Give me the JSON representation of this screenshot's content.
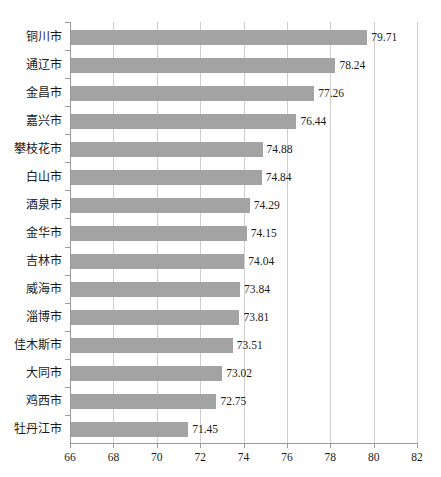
{
  "chart_data": {
    "type": "bar",
    "orientation": "horizontal",
    "title": "",
    "subtitle": "",
    "xlabel": "",
    "ylabel": "",
    "xlim": [
      66,
      82
    ],
    "ylim": null,
    "grid": "vertical",
    "legend": null,
    "legend_position": "none",
    "bar_color": "#a3a3a3",
    "axis_color": "#9a9a9a",
    "gridline_color": "#cfcfcf",
    "xticks": [
      66,
      68,
      70,
      72,
      74,
      76,
      78,
      80,
      82
    ],
    "xtick_labels": [
      "66",
      "68",
      "70",
      "72",
      "74",
      "76",
      "78",
      "80",
      "82"
    ],
    "categories": [
      "铜川市",
      "通辽市",
      "金昌市",
      "嘉兴市",
      "攀枝花市",
      "白山市",
      "酒泉市",
      "金华市",
      "吉林市",
      "威海市",
      "淄博市",
      "佳木斯市",
      "大同市",
      "鸡西市",
      "牡丹江市"
    ],
    "values": [
      79.71,
      78.24,
      77.26,
      76.44,
      74.88,
      74.84,
      74.29,
      74.15,
      74.04,
      73.84,
      73.81,
      73.51,
      73.02,
      72.75,
      71.45
    ],
    "value_labels": [
      "79.71",
      "78.24",
      "77.26",
      "76.44",
      "74.88",
      "74.84",
      "74.29",
      "74.15",
      "74.04",
      "73.84",
      "73.81",
      "73.51",
      "73.02",
      "72.75",
      "71.45"
    ]
  }
}
